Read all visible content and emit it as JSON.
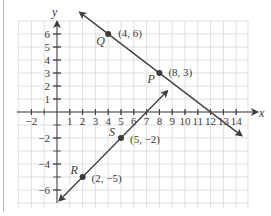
{
  "axes": {
    "x_label": "x",
    "y_label": "y",
    "x_ticks": [
      {
        "value": -2,
        "label": "−2"
      },
      {
        "value": 1,
        "label": "1"
      },
      {
        "value": 2,
        "label": "2"
      },
      {
        "value": 3,
        "label": "3"
      },
      {
        "value": 4,
        "label": "4"
      },
      {
        "value": 5,
        "label": "5"
      },
      {
        "value": 6,
        "label": "6"
      },
      {
        "value": 7,
        "label": "7"
      },
      {
        "value": 8,
        "label": "8"
      },
      {
        "value": 9,
        "label": "9"
      },
      {
        "value": 10,
        "label": "10"
      },
      {
        "value": 11,
        "label": "11"
      },
      {
        "value": 12,
        "label": "12"
      },
      {
        "value": 13,
        "label": "13"
      },
      {
        "value": 14,
        "label": "14"
      }
    ],
    "y_ticks": [
      {
        "value": 6,
        "label": "6"
      },
      {
        "value": 5,
        "label": "5"
      },
      {
        "value": 4,
        "label": "4"
      },
      {
        "value": 3,
        "label": "3"
      },
      {
        "value": 2,
        "label": "2"
      },
      {
        "value": 1,
        "label": "1"
      },
      {
        "value": -2,
        "label": "−2"
      },
      {
        "value": -4,
        "label": "−4"
      },
      {
        "value": -6,
        "label": "−6"
      }
    ]
  },
  "points": {
    "Q": {
      "name": "Q",
      "coord": "(4, 6)",
      "x": 4,
      "y": 6
    },
    "P": {
      "name": "P",
      "coord": "(8, 3)",
      "x": 8,
      "y": 3
    },
    "S": {
      "name": "S",
      "coord": "(5, −2)",
      "x": 5,
      "y": -2
    },
    "R": {
      "name": "R",
      "coord": "(2, −5)",
      "x": 2,
      "y": -5
    }
  },
  "lines": [
    {
      "name": "line-QP",
      "through": [
        "Q",
        "P"
      ],
      "slope": "-3/4"
    },
    {
      "name": "line-RS",
      "through": [
        "R",
        "S"
      ],
      "slope": "1"
    }
  ],
  "colors": {
    "grid": "#d9d9d9",
    "axis": "#3a3a3a",
    "line": "#4a4a4a",
    "point": "#3a3a3a"
  },
  "chart_data": {
    "type": "line",
    "title": "",
    "xlabel": "x",
    "ylabel": "y",
    "xlim": [
      -3,
      14.5
    ],
    "ylim": [
      -7,
      7
    ],
    "grid": true,
    "series": [
      {
        "name": "Line through Q and P",
        "x": [
          4,
          8
        ],
        "y": [
          6,
          3
        ],
        "labels": [
          "Q (4, 6)",
          "P (8, 3)"
        ]
      },
      {
        "name": "Line through R and S",
        "x": [
          2,
          5
        ],
        "y": [
          -5,
          -2
        ],
        "labels": [
          "R (2, −5)",
          "S (5, −2)"
        ]
      }
    ]
  }
}
